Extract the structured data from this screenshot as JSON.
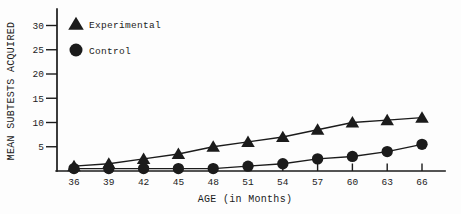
{
  "figure": {
    "background": "#fdfdfd",
    "ink": "#1b1b1b"
  },
  "chart_data": {
    "type": "line",
    "title": "",
    "xlabel": "AGE (in Months)",
    "ylabel": "MEAN SUBTESTS ACQUIRED",
    "x": [
      36,
      39,
      42,
      45,
      48,
      51,
      54,
      57,
      60,
      63,
      66
    ],
    "xticks": [
      36,
      39,
      42,
      45,
      48,
      51,
      54,
      57,
      60,
      63,
      66
    ],
    "yticks": [
      5,
      10,
      15,
      20,
      25,
      30
    ],
    "xlim": [
      34.5,
      68
    ],
    "ylim": [
      0,
      33.5
    ],
    "grid": false,
    "legend_position": "top-left",
    "series": [
      {
        "name": "Experimental",
        "marker": "triangle",
        "color": "#1b1b1b",
        "values": [
          1,
          1.5,
          2.5,
          3.5,
          5,
          6,
          7,
          8.5,
          10,
          10.5,
          11
        ]
      },
      {
        "name": "Control",
        "marker": "circle",
        "color": "#1b1b1b",
        "values": [
          0.5,
          0.5,
          0.5,
          0.5,
          0.5,
          1,
          1.5,
          2.5,
          3,
          4,
          5.5
        ]
      }
    ]
  }
}
